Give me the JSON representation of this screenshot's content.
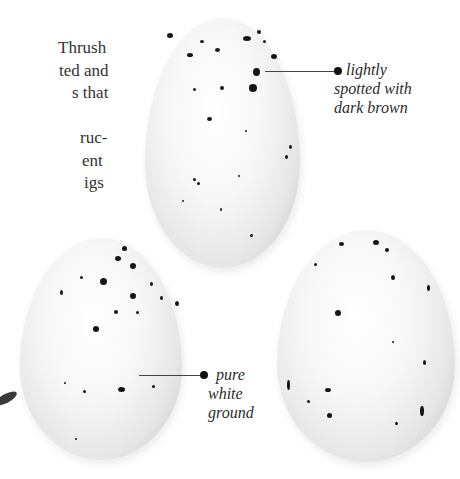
{
  "body_text": {
    "lines": [
      "Thrush",
      "ted and",
      "s that",
      "",
      "ruc-",
      "ent",
      "igs"
    ]
  },
  "captions": {
    "top_egg": [
      "lightly",
      "spotted with",
      "dark brown"
    ],
    "left_egg": [
      "pure",
      "white",
      "ground"
    ]
  },
  "colors": {
    "text": "#333333",
    "spots": "#1a1410",
    "background": "#ffffff"
  }
}
